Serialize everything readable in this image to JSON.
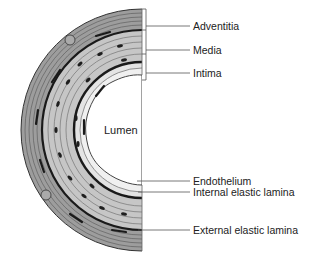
{
  "diagram": {
    "lumen_label": "Lumen",
    "labels": [
      {
        "id": "adventitia",
        "text": "Adventitia",
        "x": 193,
        "y": 21
      },
      {
        "id": "media",
        "text": "Media",
        "x": 193,
        "y": 45
      },
      {
        "id": "intima",
        "text": "Intima",
        "x": 193,
        "y": 68
      },
      {
        "id": "endothelium",
        "text": "Endothelium",
        "x": 193,
        "y": 176
      },
      {
        "id": "internal-elastic-lamina",
        "text": "Internal elastic lamina",
        "x": 193,
        "y": 187
      },
      {
        "id": "external-elastic-lamina",
        "text": "External elastic lamina",
        "x": 193,
        "y": 226
      }
    ],
    "colors": {
      "adventitia": "#9a9a9a",
      "media": "#c4c4c4",
      "intima": "#dedede",
      "lamina": "#1a1a1a",
      "outline": "#444444"
    }
  }
}
